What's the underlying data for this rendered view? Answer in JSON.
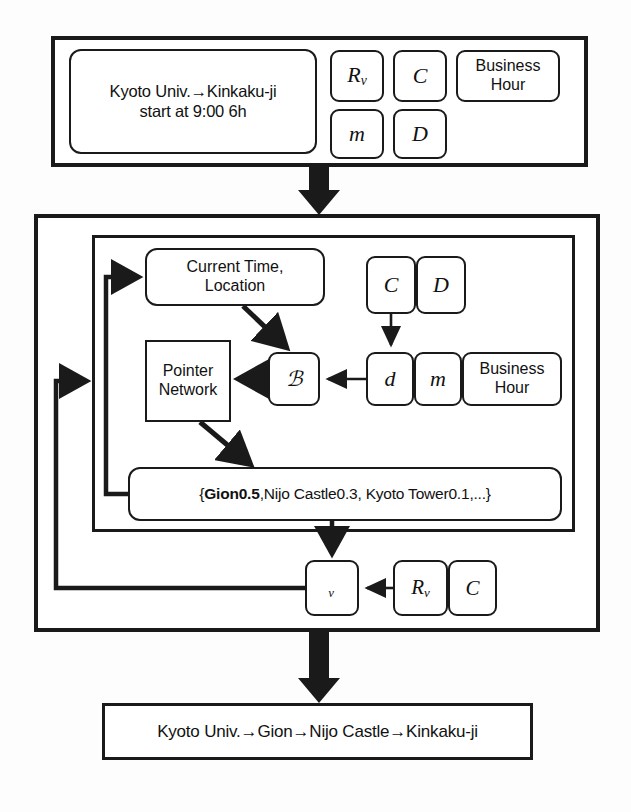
{
  "figure": {
    "type": "flow-diagram"
  },
  "input_section": {
    "query_box": {
      "line1": "Kyoto Univ.→Kinkaku-ji",
      "line2": "start at 9:00 6h"
    },
    "params": [
      {
        "id": "Rv",
        "label": "R",
        "sub": "v"
      },
      {
        "id": "C",
        "label": "C",
        "sub": ""
      },
      {
        "id": "BusinessHour",
        "label": "Business Hour",
        "sub": ""
      },
      {
        "id": "m",
        "label": "m",
        "sub": ""
      },
      {
        "id": "D",
        "label": "D",
        "sub": ""
      }
    ]
  },
  "model_section": {
    "state_box": {
      "line1": "Current Time,",
      "line2": "Location"
    },
    "pointer_network": {
      "line1": "Pointer",
      "line2": "Network"
    },
    "attention_symbol": "ℬ",
    "attention_symbol_name": "script-A",
    "value_symbol": "ᵥ",
    "value_symbol_name": "script-V",
    "feature_top": [
      {
        "id": "C",
        "label": "C"
      },
      {
        "id": "D",
        "label": "D"
      }
    ],
    "feature_row": [
      {
        "id": "d",
        "label": "d"
      },
      {
        "id": "m",
        "label": "m"
      },
      {
        "id": "BusinessHour",
        "label": "Business Hour"
      }
    ],
    "distribution": {
      "open": "{",
      "highlight": "Gion0.5",
      "rest": ",Nijo Castle0.3, Kyoto Tower0.1,...",
      "close": "}",
      "items": [
        {
          "name": "Gion",
          "prob": "0.5",
          "bold": true
        },
        {
          "name": "Nijo Castle",
          "prob": "0.3",
          "bold": false
        },
        {
          "name": "Kyoto Tower",
          "prob": "0.1",
          "bold": false
        },
        {
          "name": "...",
          "prob": "",
          "bold": false
        }
      ]
    },
    "value_inputs": [
      {
        "id": "Rv",
        "label": "R",
        "sub": "v"
      },
      {
        "id": "C",
        "label": "C",
        "sub": ""
      }
    ]
  },
  "output_section": {
    "route": "Kyoto Univ.→Gion→Nijo Castle→Kinkaku-ji"
  },
  "colors": {
    "stroke": "#1a1a1a",
    "fill": "#ffffff",
    "background": "#ffffff"
  }
}
